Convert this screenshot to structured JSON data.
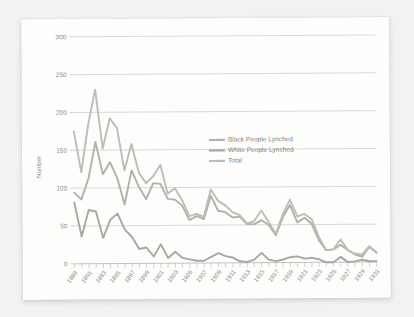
{
  "chart_data": {
    "type": "line",
    "title": "",
    "xlabel": "",
    "ylabel": "Number",
    "ylim": [
      0,
      300
    ],
    "yticks": [
      0,
      50,
      100,
      150,
      200,
      250,
      300
    ],
    "grid": true,
    "legend_position": "center",
    "x": [
      1889,
      1890,
      1891,
      1892,
      1893,
      1894,
      1895,
      1896,
      1897,
      1898,
      1899,
      1900,
      1901,
      1902,
      1903,
      1904,
      1905,
      1906,
      1907,
      1908,
      1909,
      1910,
      1911,
      1912,
      1913,
      1914,
      1915,
      1916,
      1917,
      1918,
      1919,
      1920,
      1921,
      1922,
      1923,
      1924,
      1925,
      1926,
      1927,
      1928,
      1929,
      1930,
      1931
    ],
    "xtick_labels": [
      "1889",
      "1891",
      "1893",
      "1895",
      "1897",
      "1899",
      "1901",
      "1903",
      "1905",
      "1907",
      "1909",
      "1911",
      "1913",
      "1915",
      "1917",
      "1919",
      "1921",
      "1923",
      "1925",
      "1927",
      "1929",
      "1931"
    ],
    "series": [
      {
        "name": "Black People Lynched",
        "color": "#b0b0ad",
        "values": [
          94,
          85,
          113,
          161,
          118,
          134,
          113,
          78,
          123,
          101,
          85,
          106,
          105,
          85,
          84,
          76,
          57,
          62,
          58,
          89,
          69,
          67,
          60,
          61,
          51,
          51,
          56,
          50,
          36,
          60,
          76,
          53,
          59,
          51,
          29,
          16,
          17,
          23,
          16,
          10,
          7,
          20,
          12
        ],
        "y_at_peak": 161
      },
      {
        "name": "White People Lynched",
        "color": "#a7a7a4",
        "values": [
          81,
          36,
          71,
          69,
          34,
          58,
          66,
          45,
          35,
          19,
          21,
          9,
          25,
          7,
          15,
          7,
          5,
          3,
          3,
          8,
          13,
          9,
          7,
          2,
          1,
          4,
          13,
          4,
          2,
          4,
          7,
          8,
          5,
          6,
          4,
          0,
          0,
          7,
          0,
          1,
          3,
          1,
          1
        ],
        "y_at_peak": 81
      },
      {
        "name": "Total",
        "color": "#bcbcb9",
        "values": [
          175,
          121,
          184,
          230,
          152,
          192,
          179,
          123,
          158,
          120,
          106,
          115,
          130,
          92,
          99,
          83,
          62,
          65,
          61,
          97,
          82,
          76,
          67,
          63,
          52,
          55,
          69,
          54,
          38,
          64,
          83,
          61,
          64,
          57,
          33,
          16,
          17,
          30,
          16,
          11,
          10,
          21,
          13
        ],
        "y_at_peak": 230
      }
    ]
  },
  "axis": {
    "y_title": "Number",
    "y_tick_labels": [
      "0",
      "50",
      "100",
      "150",
      "200",
      "250",
      "300"
    ]
  },
  "legend": {
    "entries": [
      {
        "label": "Black People Lynched"
      },
      {
        "label": "White People Lynched"
      },
      {
        "label": "Total"
      }
    ]
  }
}
